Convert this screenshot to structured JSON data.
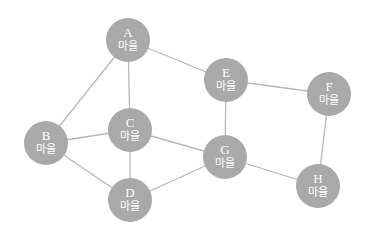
{
  "diagram": {
    "node_color": "#a9a9a9",
    "edge_color": "#b8b8b8",
    "nodes": [
      {
        "id": "A",
        "label": "A",
        "sub": "마을",
        "x": 128,
        "y": 40
      },
      {
        "id": "B",
        "label": "B",
        "sub": "마을",
        "x": 46,
        "y": 143
      },
      {
        "id": "C",
        "label": "C",
        "sub": "마을",
        "x": 130,
        "y": 130
      },
      {
        "id": "D",
        "label": "D",
        "sub": "마을",
        "x": 130,
        "y": 200
      },
      {
        "id": "E",
        "label": "E",
        "sub": "마을",
        "x": 226,
        "y": 80
      },
      {
        "id": "F",
        "label": "F",
        "sub": "마을",
        "x": 329,
        "y": 94
      },
      {
        "id": "G",
        "label": "G",
        "sub": "마을",
        "x": 225,
        "y": 157
      },
      {
        "id": "H",
        "label": "H",
        "sub": "마을",
        "x": 318,
        "y": 186
      }
    ],
    "edges": [
      [
        "A",
        "B"
      ],
      [
        "A",
        "C"
      ],
      [
        "A",
        "E"
      ],
      [
        "B",
        "C"
      ],
      [
        "B",
        "D"
      ],
      [
        "C",
        "D"
      ],
      [
        "C",
        "G"
      ],
      [
        "D",
        "G"
      ],
      [
        "E",
        "G"
      ],
      [
        "E",
        "F"
      ],
      [
        "F",
        "H"
      ],
      [
        "G",
        "H"
      ]
    ]
  }
}
